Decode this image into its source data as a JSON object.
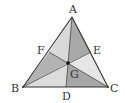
{
  "diagram": {
    "vertices": {
      "A": {
        "label": "A"
      },
      "B": {
        "label": "B"
      },
      "C": {
        "label": "C"
      }
    },
    "midpoints": {
      "D": {
        "label": "D",
        "on_side": "BC"
      },
      "E": {
        "label": "E",
        "on_side": "CA"
      },
      "F": {
        "label": "F",
        "on_side": "AB"
      }
    },
    "centroid": {
      "label": "G"
    },
    "regions": [
      {
        "name": "AFG",
        "shade": "#d9d9d9"
      },
      {
        "name": "AGE",
        "shade": "#a9a9a9"
      },
      {
        "name": "FBG",
        "shade": "#b3b3b3"
      },
      {
        "name": "BDG",
        "shade": "#dcdcdc"
      },
      {
        "name": "DCG",
        "shade": "#a6a6a6"
      },
      {
        "name": "GCE",
        "shade": "#e6e6e6"
      }
    ],
    "colors": {
      "stroke": "#333333",
      "label": "#333333"
    }
  }
}
